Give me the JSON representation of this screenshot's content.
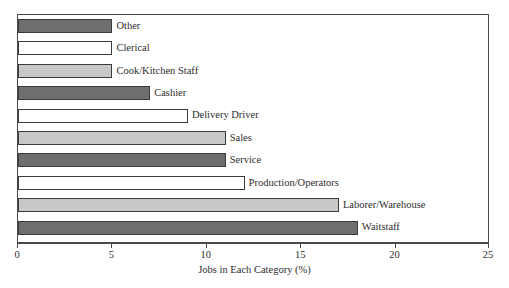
{
  "chart_data": {
    "type": "bar",
    "orientation": "horizontal",
    "title": "",
    "subtitle": "",
    "xlabel": "Jobs in Each Category (%)",
    "ylabel": "",
    "xlim": [
      0,
      25
    ],
    "xticks": [
      0,
      5,
      10,
      15,
      20,
      25
    ],
    "xtick_labels": [
      "0",
      "5",
      "10",
      "15",
      "20",
      "25"
    ],
    "grid": false,
    "legend": "none",
    "categories": [
      "Other",
      "Clerical",
      "Cook/Kitchen Staff",
      "Cashier",
      "Delivery Driver",
      "Sales",
      "Service",
      "Production/Operators",
      "Laborer/Warehouse",
      "Waitstaff"
    ],
    "values": [
      5,
      5,
      5,
      7,
      9,
      11,
      11,
      12,
      17,
      18
    ],
    "bar_colors": [
      "#6e6e6e",
      "#ffffff",
      "#c8c8c8",
      "#6e6e6e",
      "#ffffff",
      "#c8c8c8",
      "#6e6e6e",
      "#ffffff",
      "#c8c8c8",
      "#6e6e6e"
    ],
    "bar_edge_color": "#3b3b3b",
    "frame_color": "#4a4a4a",
    "background_color": "#ffffff",
    "bars": [
      {
        "label": "Other",
        "value": 5,
        "color": "#6e6e6e"
      },
      {
        "label": "Clerical",
        "value": 5,
        "color": "#ffffff"
      },
      {
        "label": "Cook/Kitchen Staff",
        "value": 5,
        "color": "#c8c8c8"
      },
      {
        "label": "Cashier",
        "value": 7,
        "color": "#6e6e6e"
      },
      {
        "label": "Delivery Driver",
        "value": 9,
        "color": "#ffffff"
      },
      {
        "label": "Sales",
        "value": 11,
        "color": "#c8c8c8"
      },
      {
        "label": "Service",
        "value": 11,
        "color": "#6e6e6e"
      },
      {
        "label": "Production/Operators",
        "value": 12,
        "color": "#ffffff"
      },
      {
        "label": "Laborer/Warehouse",
        "value": 17,
        "color": "#c8c8c8"
      },
      {
        "label": "Waitstaff",
        "value": 18,
        "color": "#6e6e6e"
      }
    ]
  }
}
